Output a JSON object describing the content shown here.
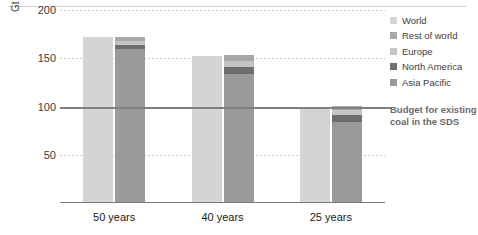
{
  "chart_data": {
    "type": "bar",
    "title": "",
    "xlabel": "",
    "ylabel": "Gt",
    "ylim": [
      0,
      200
    ],
    "yticks": [
      50,
      100,
      150,
      200
    ],
    "grid": true,
    "legend_position": "right",
    "categories": [
      "50 years",
      "40 years",
      "25 years"
    ],
    "series": [
      {
        "name": "World",
        "color": "#d4d4d4",
        "values": [
          172,
          152,
          100
        ]
      },
      {
        "name": "Rest of world",
        "color": "#a8a8a8",
        "values": [
          4,
          6,
          5
        ]
      },
      {
        "name": "Europe",
        "color": "#c4c4c4",
        "values": [
          4,
          6,
          5
        ]
      },
      {
        "name": "North America",
        "color": "#6e6e6e",
        "values": [
          4,
          7,
          7
        ]
      },
      {
        "name": "Asia Pacific",
        "color": "#9a9a9a",
        "values": [
          160,
          134,
          84
        ]
      }
    ],
    "stacked_bar_totals": [
      172,
      153,
      101
    ],
    "annotations": [
      {
        "type": "hline",
        "value": 100,
        "label": "Budget for existing coal in the SDS",
        "color": "#808080"
      }
    ]
  },
  "axis": {
    "unit": "Gt",
    "yticks": [
      "200",
      "150",
      "100",
      "50"
    ],
    "xticks": [
      "50 years",
      "40 years",
      "25 years"
    ]
  },
  "legend": {
    "items": [
      {
        "label": "World"
      },
      {
        "label": "Rest of world"
      },
      {
        "label": "Europe"
      },
      {
        "label": "North America"
      },
      {
        "label": "Asia Pacific"
      }
    ]
  },
  "budget": {
    "callout": "Budget for existing coal in the SDS"
  }
}
